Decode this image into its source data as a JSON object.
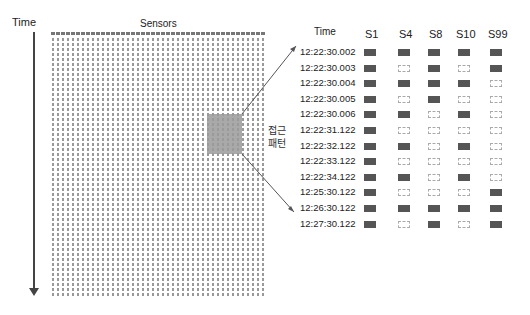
{
  "diagram": {
    "time_axis_label": "Time",
    "sensors_label": "Sensors",
    "highlight_label": "접근\n패턴",
    "highlight_label_lines": [
      "접근",
      "패턴"
    ],
    "grid_columns": 43,
    "colors": {
      "on": "#555555",
      "off_border": "#aaaaaa",
      "highlight": "#9a9a9a",
      "axis": "#444444"
    }
  },
  "table": {
    "time_header": "Time",
    "sensors": [
      "S1",
      "S4",
      "S8",
      "S10",
      "S99"
    ],
    "rows": [
      {
        "time": "12:22:30.002",
        "states": [
          1,
          1,
          1,
          1,
          1
        ]
      },
      {
        "time": "12:22:30.003",
        "states": [
          1,
          0,
          1,
          0,
          1
        ]
      },
      {
        "time": "12:22:30.004",
        "states": [
          1,
          1,
          1,
          1,
          0
        ]
      },
      {
        "time": "12:22:30.005",
        "states": [
          1,
          0,
          1,
          0,
          0
        ]
      },
      {
        "time": "12:22:30.006",
        "states": [
          1,
          1,
          0,
          1,
          0
        ]
      },
      {
        "time": "12:22:31.122",
        "states": [
          1,
          0,
          0,
          0,
          0
        ]
      },
      {
        "time": "12:22:32.122",
        "states": [
          1,
          1,
          0,
          1,
          0
        ]
      },
      {
        "time": "12:22:33.122",
        "states": [
          1,
          0,
          0,
          0,
          0
        ]
      },
      {
        "time": "12:22:34.122",
        "states": [
          1,
          1,
          0,
          1,
          0
        ]
      },
      {
        "time": "12:25:30.122",
        "states": [
          1,
          0,
          0,
          0,
          1
        ]
      },
      {
        "time": "12:26:30.122",
        "states": [
          1,
          1,
          1,
          1,
          1
        ]
      },
      {
        "time": "12:27:30.122",
        "states": [
          1,
          0,
          1,
          0,
          1
        ]
      }
    ]
  }
}
